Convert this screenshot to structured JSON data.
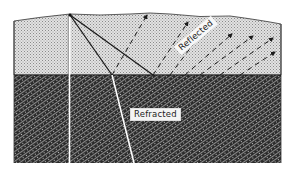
{
  "figure": {
    "labels": {
      "reflected": "Reflected",
      "refracted": "Refracted"
    },
    "layers": [
      {
        "name": "upper-layer",
        "pattern": "light stipple",
        "color": "#c9c9c9"
      },
      {
        "name": "lower-layer",
        "pattern": "dark diagonal crosshatch",
        "color": "#2a2a2a"
      }
    ],
    "colors": {
      "upper_layer": "#cfcfcf",
      "lower_layer": "#2b2b2b",
      "ray_lines": "#1a1a1a",
      "white_lines": "#ffffff",
      "background": "#ffffff"
    }
  }
}
